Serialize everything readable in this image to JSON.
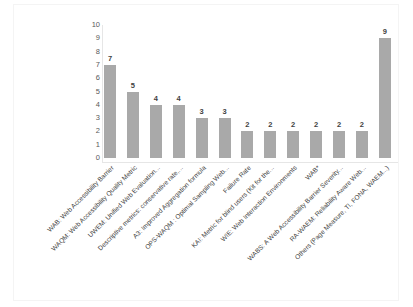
{
  "chart_data": {
    "type": "bar",
    "title": "",
    "subtitle": "",
    "xlabel": "",
    "ylabel": "",
    "ylim": [
      0,
      10
    ],
    "yticks": [
      "10",
      "9",
      "8",
      "7",
      "6",
      "5",
      "4",
      "3",
      "2",
      "1",
      "0"
    ],
    "grid": false,
    "legend": false,
    "orientation": "vertical",
    "bar_color": "#a9a9a9",
    "label_rotation_degrees": 45,
    "categories": [
      "WAB: Web Accessibility Barrier",
      "WAQM: Web Accessibility Quality Metric",
      "UWEM: Unified Web Evaluation...",
      "Descriptive metrics: conservative rate,...",
      "A3: Improved Aggregation formula",
      "OPS-WAQM : Optimal Sampling Web...",
      "Failure Rate",
      "KAI: Metric for blind users (Kit for the...",
      "WIE: Web Interaction Environments",
      "WAB*",
      "WABS: A Web Accessibility Barrier Severity...",
      "RA-WAEM: Reliability Aware Web...",
      "Others (Page Measure, TI, FONA, WAEM...)"
    ],
    "values": [
      7,
      5,
      4,
      4,
      3,
      3,
      2,
      2,
      2,
      2,
      2,
      2,
      9
    ],
    "value_labels": [
      "7",
      "5",
      "4",
      "4",
      "3",
      "3",
      "2",
      "2",
      "2",
      "2",
      "2",
      "2",
      "9"
    ]
  }
}
